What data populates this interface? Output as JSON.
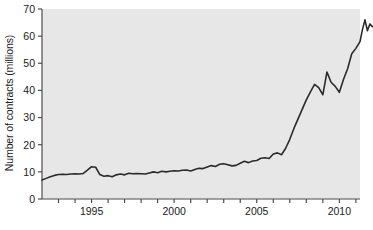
{
  "chart_data": {
    "type": "line",
    "title": "",
    "xlabel": "",
    "ylabel": "Number of contracts (millions)",
    "xlim": [
      1992.0,
      2011.25
    ],
    "ylim": [
      0,
      70
    ],
    "yticks": [
      0,
      10,
      20,
      30,
      40,
      50,
      60,
      70
    ],
    "ytick_labels": [
      "0",
      "10",
      "20",
      "30",
      "40",
      "50",
      "60",
      "70"
    ],
    "xticks_major": [
      1995,
      2000,
      2005,
      2010
    ],
    "xtick_labels": [
      "1995",
      "2000",
      "2005",
      "2010"
    ],
    "xticks_minor": [
      1993,
      1994,
      1996,
      1997,
      1998,
      1999,
      2001,
      2002,
      2003,
      2004,
      2006,
      2007,
      2008,
      2009,
      2011
    ],
    "grid": false,
    "legend": null,
    "plot_background": "#e7e7e7",
    "line_color": "#2b2b2b",
    "line_width": 1.6,
    "series": [
      {
        "name": "Number of contracts",
        "x": [
          1992.0,
          1992.25,
          1992.5,
          1992.75,
          1993.0,
          1993.25,
          1993.5,
          1993.75,
          1994.0,
          1994.25,
          1994.5,
          1994.75,
          1995.0,
          1995.25,
          1995.5,
          1995.75,
          1996.0,
          1996.25,
          1996.5,
          1996.75,
          1997.0,
          1997.25,
          1997.5,
          1997.75,
          1998.0,
          1998.25,
          1998.5,
          1998.75,
          1999.0,
          1999.25,
          1999.5,
          1999.75,
          2000.0,
          2000.25,
          2000.5,
          2000.75,
          2001.0,
          2001.25,
          2001.5,
          2001.75,
          2002.0,
          2002.25,
          2002.5,
          2002.75,
          2003.0,
          2003.25,
          2003.5,
          2003.75,
          2004.0,
          2004.25,
          2004.5,
          2004.75,
          2005.0,
          2005.25,
          2005.5,
          2005.75,
          2006.0,
          2006.25,
          2006.5,
          2006.75,
          2007.0,
          2007.25,
          2007.5,
          2007.75,
          2008.0,
          2008.25,
          2008.5,
          2008.75,
          2009.0,
          2009.25,
          2009.5,
          2009.75,
          2010.0,
          2010.25,
          2010.5,
          2010.75,
          2011.0,
          2011.25
        ],
        "y": [
          7.0,
          7.6,
          8.2,
          8.7,
          9.0,
          9.1,
          9.0,
          9.2,
          9.3,
          9.2,
          9.4,
          10.6,
          11.9,
          11.7,
          9.0,
          8.4,
          8.6,
          8.2,
          8.9,
          9.2,
          8.9,
          9.5,
          9.3,
          9.4,
          9.3,
          9.2,
          9.6,
          10.0,
          9.7,
          10.2,
          10.0,
          10.2,
          10.4,
          10.3,
          10.6,
          10.7,
          10.3,
          10.9,
          11.3,
          11.2,
          11.8,
          12.3,
          12.0,
          12.8,
          13.0,
          12.6,
          12.2,
          12.4,
          13.2,
          13.9,
          13.4,
          14.0,
          14.2,
          15.0,
          15.2,
          14.9,
          16.6,
          17.0,
          16.3,
          18.7,
          22.0,
          26.0,
          29.5,
          33.0,
          36.5,
          39.5,
          42.2,
          41.0,
          38.4,
          46.8,
          43.0,
          41.5,
          39.3,
          44.0,
          48.0,
          53.5,
          55.5,
          58.0
        ]
      },
      {
        "name": "Number of contracts (tail)",
        "x": [
          2011.4,
          2011.55,
          2011.7,
          2011.85,
          2012.0
        ],
        "y": [
          62.5,
          66.0,
          62.0,
          64.5,
          63.5
        ]
      }
    ]
  },
  "axes": {
    "left_ticks_name": "y-axis-ticks",
    "bottom_ticks_name": "x-axis-ticks"
  }
}
